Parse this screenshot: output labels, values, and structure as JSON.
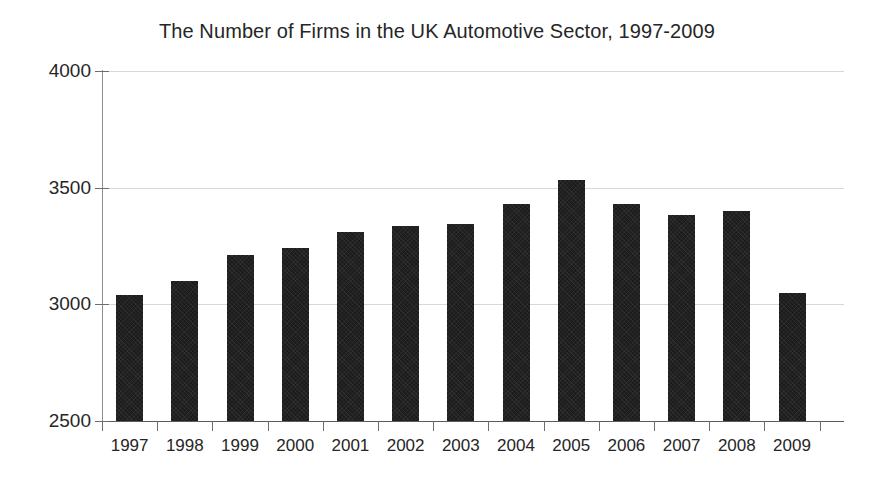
{
  "chart_data": {
    "type": "bar",
    "title": "The Number of Firms in the UK Automotive Sector, 1997-2009",
    "xlabel": "",
    "ylabel": "",
    "categories": [
      "1997",
      "1998",
      "1999",
      "2000",
      "2001",
      "2002",
      "2003",
      "2004",
      "2005",
      "2006",
      "2007",
      "2008",
      "2009"
    ],
    "values": [
      3040,
      3100,
      3210,
      3240,
      3310,
      3335,
      3345,
      3430,
      3535,
      3430,
      3385,
      3400,
      3050
    ],
    "ylim": [
      2500,
      4000
    ],
    "ytick_labels": [
      "2500",
      "3000",
      "3500",
      "4000"
    ],
    "yticks": [
      2500,
      3000,
      3500,
      4000
    ],
    "grid": true,
    "grid_axis": "y",
    "legend": false,
    "bar_color": "#1c1c1c",
    "background_color": "#ffffff",
    "axis_color": "#6e6e6e",
    "grid_color": "#d8d8d8",
    "text_color": "#262626"
  }
}
